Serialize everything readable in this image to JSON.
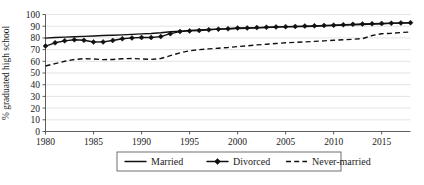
{
  "chart_data": {
    "type": "line",
    "title": "",
    "xlabel": "",
    "ylabel": "% graduated high school",
    "xlim": [
      1980,
      2018
    ],
    "ylim": [
      0,
      100
    ],
    "grid": true,
    "legend_position": "bottom-center",
    "xticks": [
      "1980",
      "1985",
      "1990",
      "1995",
      "2000",
      "2005",
      "2010",
      "2015"
    ],
    "xtick_values": [
      1980,
      1985,
      1990,
      1995,
      2000,
      2005,
      2010,
      2015
    ],
    "yticks": [
      "0",
      "10",
      "20",
      "30",
      "40",
      "50",
      "60",
      "70",
      "80",
      "90",
      "100"
    ],
    "ytick_values": [
      0,
      10,
      20,
      30,
      40,
      50,
      60,
      70,
      80,
      90,
      100
    ],
    "x": [
      1980,
      1981,
      1982,
      1983,
      1984,
      1985,
      1986,
      1987,
      1988,
      1989,
      1990,
      1991,
      1992,
      1993,
      1994,
      1995,
      1996,
      1997,
      1998,
      1999,
      2000,
      2001,
      2002,
      2003,
      2004,
      2005,
      2006,
      2007,
      2008,
      2009,
      2010,
      2011,
      2012,
      2013,
      2014,
      2015,
      2016,
      2017,
      2018
    ],
    "series": [
      {
        "name": "Married",
        "style": "solid",
        "marker": "none",
        "color": "#111111",
        "values": [
          79.8,
          80.3,
          80.7,
          81.0,
          81.3,
          81.6,
          82.0,
          82.3,
          82.6,
          83.0,
          83.4,
          83.8,
          84.4,
          85.2,
          85.8,
          86.4,
          86.8,
          87.2,
          87.5,
          87.8,
          88.0,
          88.3,
          88.6,
          88.9,
          89.2,
          89.4,
          89.6,
          89.8,
          90.0,
          90.3,
          90.6,
          90.9,
          91.2,
          91.5,
          91.8,
          92.1,
          92.4,
          92.6,
          92.8
        ]
      },
      {
        "name": "Divorced",
        "style": "solid",
        "marker": "diamond",
        "color": "#111111",
        "values": [
          73.0,
          75.8,
          77.5,
          78.4,
          78.0,
          76.5,
          76.6,
          77.8,
          79.3,
          80.0,
          80.4,
          80.3,
          81.1,
          83.6,
          85.4,
          86.0,
          86.3,
          86.9,
          87.5,
          87.8,
          88.4,
          88.5,
          88.8,
          89.1,
          89.4,
          89.6,
          89.8,
          90.1,
          90.3,
          90.6,
          90.9,
          91.2,
          91.6,
          91.9,
          92.1,
          92.3,
          92.6,
          92.8,
          93.0
        ]
      },
      {
        "name": "Never-married",
        "style": "dashed",
        "marker": "none",
        "color": "#111111",
        "values": [
          56.0,
          58.0,
          60.0,
          61.5,
          62.3,
          62.0,
          61.4,
          61.6,
          62.2,
          62.4,
          62.0,
          61.6,
          62.4,
          64.8,
          67.2,
          69.0,
          70.0,
          70.6,
          71.2,
          71.8,
          72.6,
          73.2,
          74.0,
          74.6,
          75.2,
          75.8,
          76.2,
          76.6,
          77.0,
          77.5,
          78.0,
          78.4,
          78.8,
          79.4,
          82.0,
          83.6,
          84.0,
          84.6,
          85.0
        ]
      }
    ]
  },
  "legend": {
    "entries": [
      {
        "label": "Married",
        "style": "solid",
        "marker": "none"
      },
      {
        "label": "Divorced",
        "style": "solid",
        "marker": "diamond"
      },
      {
        "label": "Never-married",
        "style": "dashed",
        "marker": "none"
      }
    ]
  }
}
